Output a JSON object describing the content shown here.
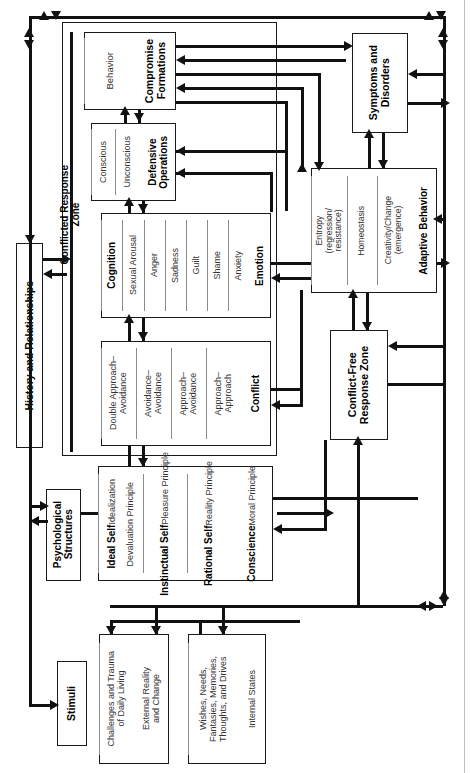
{
  "figure": {
    "caption": "The Architecture of Human Behavior"
  },
  "zones": {
    "conflicted": "Conflicted Response\nZone",
    "conflict_free": "Conflict-Free\nResponse Zone"
  },
  "boxes": {
    "compromise_formations": {
      "title": "Compromise\nFormations",
      "items": [
        "Behavior"
      ]
    },
    "defensive_operations": {
      "title": "Defensive\nOperations",
      "items": [
        "Unconscious",
        "Conscious"
      ]
    },
    "emotion": {
      "title": "Emotion",
      "items": [
        "Anxiety",
        "Shame",
        "Guilt",
        "Sadness",
        "Anger",
        "Sexual Arousal"
      ],
      "title_end": "Cognition"
    },
    "conflict": {
      "title": "Conflict",
      "items": [
        "Approach–\nApproach",
        "Approach–\nAvoidance",
        "Avoidance–\nAvoidance",
        "Double Approach–\nAvoidance"
      ]
    },
    "psych_structures_content": {
      "items": [
        {
          "bold": "Conscience",
          "reg": "Moral Principle"
        },
        {
          "bold": "Rational Self",
          "reg": "Reality Principle"
        },
        {
          "bold": "Instinctual Self",
          "reg": "Pleasure Principle"
        },
        {
          "bold": "Ideal Self",
          "reg": "Idealization\nDevaluation Principle"
        }
      ]
    },
    "symptoms_and_disorders": {
      "title": "Symptoms and\nDisorders"
    },
    "adaptive_behavior": {
      "title": "Adaptive Behavior",
      "items": [
        "Creativity/Change\n(emergence)",
        "Homeostasis",
        "Entropy\n(regression/\nresistance)"
      ]
    },
    "history_and_relationships": {
      "title": "History and Relationships"
    },
    "psychological_structures": {
      "title": "Psychological\nStructures"
    },
    "stimuli": {
      "title": "Stimuli"
    },
    "external_reality": {
      "items": [
        "External Reality\nand Change",
        "Challenges and Trauma\nof Daily Living"
      ]
    },
    "internal_states": {
      "items": [
        "Internal States",
        "Wishes, Needs,\nFantasies, Memories,\nThoughts, and Drives"
      ]
    }
  },
  "colors": {
    "ink": "#111111",
    "line": "#8a8a8a",
    "background": "#ffffff"
  }
}
